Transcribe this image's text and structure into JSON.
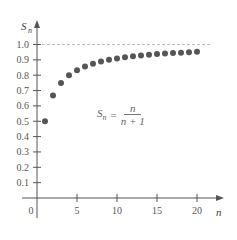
{
  "chart_data": {
    "type": "scatter",
    "title": "",
    "xlabel": "n",
    "ylabel": "S_n",
    "x_ticks": [
      "0",
      "5",
      "10",
      "15",
      "20"
    ],
    "y_ticks": [
      "0.1",
      "0.2",
      "0.3",
      "0.4",
      "0.5",
      "0.6",
      "0.7",
      "0.8",
      "0.9",
      "1.0"
    ],
    "xlim": [
      0,
      21
    ],
    "ylim": [
      0,
      1.05
    ],
    "grid": false,
    "asymptote": {
      "y": 1.0,
      "style": "dashed"
    },
    "annotation": {
      "lhs": "S",
      "lhs_sub": "n",
      "equals": "=",
      "numerator": "n",
      "denominator": "n + 1"
    },
    "series": [
      {
        "name": "S_n = n/(n+1)",
        "x": [
          1,
          2,
          3,
          4,
          5,
          6,
          7,
          8,
          9,
          10,
          11,
          12,
          13,
          14,
          15,
          16,
          17,
          18,
          19,
          20
        ],
        "values": [
          0.5,
          0.667,
          0.75,
          0.8,
          0.833,
          0.857,
          0.875,
          0.889,
          0.9,
          0.909,
          0.917,
          0.923,
          0.929,
          0.933,
          0.9375,
          0.941,
          0.944,
          0.947,
          0.95,
          0.952
        ]
      }
    ],
    "colors": {
      "points": "#555555",
      "axis": "#555555",
      "asymptote": "#bbbbbb"
    }
  }
}
